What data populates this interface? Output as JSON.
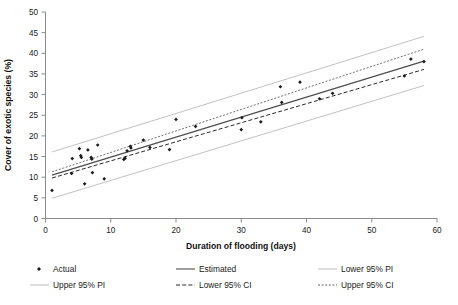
{
  "chart_data": {
    "type": "scatter",
    "title": "",
    "xlabel": "Duration of flooding (days)",
    "ylabel": "Cover of exotic species (%)",
    "xlim": [
      0,
      60
    ],
    "ylim": [
      0,
      50
    ],
    "xticks": [
      0,
      10,
      20,
      30,
      40,
      50,
      60
    ],
    "yticks": [
      0,
      5,
      10,
      15,
      20,
      25,
      30,
      35,
      40,
      45,
      50
    ],
    "grid": false,
    "legend_position": "bottom",
    "legend_columns": 3,
    "series": [
      {
        "name": "Actual",
        "type": "scatter",
        "marker": "diamond",
        "color": "#1b1b1b",
        "points": [
          [
            1.0,
            6.8
          ],
          [
            4.0,
            10.9
          ],
          [
            4.1,
            14.5
          ],
          [
            5.2,
            16.9
          ],
          [
            5.4,
            15.2
          ],
          [
            5.5,
            14.8
          ],
          [
            6.0,
            8.4
          ],
          [
            6.5,
            16.6
          ],
          [
            7.0,
            14.8
          ],
          [
            7.1,
            14.4
          ],
          [
            7.2,
            11.1
          ],
          [
            8.0,
            17.8
          ],
          [
            9.0,
            9.6
          ],
          [
            12.0,
            14.3
          ],
          [
            12.2,
            14.6
          ],
          [
            12.5,
            16.4
          ],
          [
            13.0,
            17.5
          ],
          [
            13.1,
            17.1
          ],
          [
            15.0,
            19.0
          ],
          [
            16.0,
            17.2
          ],
          [
            19.0,
            16.7
          ],
          [
            20.0,
            24.0
          ],
          [
            23.0,
            22.3
          ],
          [
            30.0,
            21.5
          ],
          [
            30.1,
            24.4
          ],
          [
            33.0,
            23.4
          ],
          [
            36.0,
            31.9
          ],
          [
            36.2,
            28.1
          ],
          [
            39.0,
            33.0
          ],
          [
            42.0,
            29.0
          ],
          [
            44.0,
            30.3
          ],
          [
            55.0,
            34.5
          ],
          [
            56.0,
            38.6
          ],
          [
            58.0,
            38.0
          ]
        ]
      },
      {
        "name": "Estimated",
        "type": "line",
        "style": "solid",
        "color": "#4d4d4d",
        "endpoints": [
          [
            1.0,
            10.5
          ],
          [
            58.0,
            38.1
          ]
        ]
      },
      {
        "name": "Lower 95% PI",
        "type": "line",
        "style": "solid-light",
        "color": "#c2c2c2",
        "endpoints": [
          [
            1.0,
            4.9
          ],
          [
            58.0,
            32.2
          ]
        ]
      },
      {
        "name": "Upper 95% PI",
        "type": "line",
        "style": "solid-light",
        "color": "#c2c2c2",
        "endpoints": [
          [
            1.0,
            16.1
          ],
          [
            58.0,
            44.1
          ]
        ]
      },
      {
        "name": "Lower 95% CI",
        "type": "line",
        "style": "dashed",
        "color": "#2b2b2b",
        "endpoints": [
          [
            1.0,
            9.8
          ],
          [
            58.0,
            36.1
          ]
        ]
      },
      {
        "name": "Upper 95% CI",
        "type": "line",
        "style": "dotted",
        "color": "#636363",
        "endpoints": [
          [
            1.0,
            11.3
          ],
          [
            58.0,
            41.0
          ]
        ]
      }
    ]
  },
  "axes": {
    "x": {
      "title": "Duration of flooding (days)",
      "tick_labels": [
        "0",
        "10",
        "20",
        "30",
        "40",
        "50",
        "60"
      ]
    },
    "y": {
      "title": "Cover of exotic species (%)",
      "tick_labels": [
        "0",
        "5",
        "10",
        "15",
        "20",
        "25",
        "30",
        "35",
        "40",
        "45",
        "50"
      ]
    }
  },
  "legend": {
    "entries": [
      {
        "label": "Actual",
        "symbol": "diamond-marker",
        "color": "#1b1b1b"
      },
      {
        "label": "Estimated",
        "symbol": "solid-line",
        "color": "#4d4d4d"
      },
      {
        "label": "Lower 95% PI",
        "symbol": "light-solid-line",
        "color": "#c2c2c2"
      },
      {
        "label": "Upper 95% PI",
        "symbol": "light-solid-line",
        "color": "#c2c2c2"
      },
      {
        "label": "Lower 95% CI",
        "symbol": "dashed-line",
        "color": "#2b2b2b"
      },
      {
        "label": "Upper 95% CI",
        "symbol": "dotted-line",
        "color": "#636363"
      }
    ]
  }
}
